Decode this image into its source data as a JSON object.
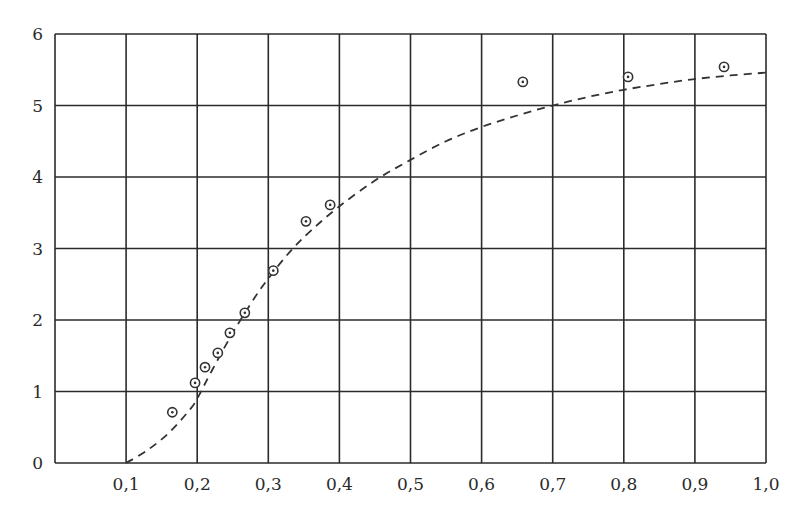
{
  "chart_data": {
    "type": "scatter",
    "title": "",
    "xlabel": "",
    "ylabel": "",
    "xlim": [
      0.0,
      1.0
    ],
    "ylim": [
      0,
      6
    ],
    "grid": true,
    "legend": null,
    "x_ticks": [
      {
        "value": 0.1,
        "label": "0,1"
      },
      {
        "value": 0.2,
        "label": "0,2"
      },
      {
        "value": 0.3,
        "label": "0,3"
      },
      {
        "value": 0.4,
        "label": "0,4"
      },
      {
        "value": 0.5,
        "label": "0,5"
      },
      {
        "value": 0.6,
        "label": "0,6"
      },
      {
        "value": 0.7,
        "label": "0,7"
      },
      {
        "value": 0.8,
        "label": "0,8"
      },
      {
        "value": 0.9,
        "label": "0,9"
      },
      {
        "value": 1.0,
        "label": "1,0"
      }
    ],
    "y_ticks": [
      {
        "value": 0,
        "label": "0"
      },
      {
        "value": 1,
        "label": "1"
      },
      {
        "value": 2,
        "label": "2"
      },
      {
        "value": 3,
        "label": "3"
      },
      {
        "value": 4,
        "label": "4"
      },
      {
        "value": 5,
        "label": "5"
      },
      {
        "value": 6,
        "label": "6"
      }
    ],
    "series": [
      {
        "name": "measured points",
        "style": "circled-dot markers",
        "x": [
          0.165,
          0.197,
          0.211,
          0.229,
          0.246,
          0.267,
          0.307,
          0.353,
          0.387,
          0.658,
          0.806,
          0.941
        ],
        "y": [
          0.71,
          1.12,
          1.34,
          1.54,
          1.82,
          2.1,
          2.69,
          3.38,
          3.61,
          5.33,
          5.4,
          5.54
        ]
      },
      {
        "name": "fitted curve",
        "style": "dashed line",
        "x": [
          0.1,
          0.13,
          0.16,
          0.19,
          0.2,
          0.22,
          0.25,
          0.28,
          0.3,
          0.33,
          0.36,
          0.4,
          0.45,
          0.5,
          0.55,
          0.6,
          0.65,
          0.7,
          0.75,
          0.8,
          0.85,
          0.9,
          0.95,
          1.0
        ],
        "y": [
          0.0,
          0.18,
          0.42,
          0.75,
          0.9,
          1.28,
          1.82,
          2.3,
          2.58,
          2.95,
          3.25,
          3.59,
          3.95,
          4.24,
          4.5,
          4.7,
          4.86,
          5.0,
          5.12,
          5.22,
          5.3,
          5.37,
          5.42,
          5.46
        ]
      }
    ]
  },
  "style": {
    "grid_color": "#2b2b2b",
    "curve_color": "#333333",
    "marker_color": "#333333",
    "background": "#ffffff"
  }
}
